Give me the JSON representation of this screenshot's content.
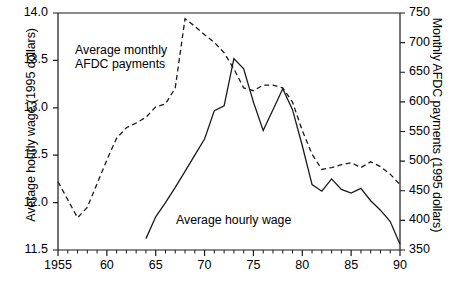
{
  "chart_data": {
    "type": "line",
    "title": "",
    "xlabel": "",
    "grid": false,
    "legend_position": "inline-annotations",
    "xlim": [
      1955,
      1990
    ],
    "x_ticks_major": [
      1955,
      1960,
      1965,
      1970,
      1975,
      1980,
      1985,
      1990
    ],
    "x_tick_labels": [
      "1955",
      "60",
      "65",
      "70",
      "75",
      "80",
      "85",
      "90"
    ],
    "x_minor_tick_interval": 1,
    "axes": {
      "left": {
        "label": "Average hourly wage (1995 dollars)",
        "ylim": [
          11.5,
          14.0
        ],
        "ticks": [
          11.5,
          12.0,
          12.5,
          13.0,
          13.5,
          14.0
        ],
        "tick_labels": [
          "11.5",
          "12.0",
          "12.5",
          "13.0",
          "13.5",
          "14.0"
        ]
      },
      "right": {
        "label": "Monthly AFDC payments (1995 dollars)",
        "ylim": [
          350,
          750
        ],
        "ticks": [
          350,
          400,
          450,
          500,
          550,
          600,
          650,
          700,
          750
        ],
        "tick_labels": [
          "350",
          "400",
          "450",
          "500",
          "550",
          "600",
          "650",
          "700",
          "750"
        ]
      }
    },
    "series": [
      {
        "name": "Average monthly AFDC payments",
        "axis": "right",
        "style": "dashed",
        "color": "#000000",
        "annotation": "Average monthly\nAFDC payments",
        "x": [
          1955,
          1956,
          1957,
          1958,
          1959,
          1960,
          1961,
          1962,
          1963,
          1964,
          1965,
          1966,
          1967,
          1968,
          1969,
          1970,
          1971,
          1972,
          1973,
          1974,
          1975,
          1976,
          1977,
          1978,
          1979,
          1980,
          1981,
          1982,
          1983,
          1984,
          1985,
          1986,
          1987,
          1988,
          1989,
          1990
        ],
        "values_right_axis": [
          471,
          440,
          409,
          432,
          470,
          512,
          549,
          566,
          574,
          584,
          601,
          607,
          634,
          740,
          727,
          713,
          700,
          683,
          655,
          622,
          617,
          627,
          626,
          622,
          600,
          552,
          512,
          486,
          489,
          494,
          497,
          489,
          499,
          491,
          478,
          460
        ],
        "values_left_axis": [
          12.22,
          12.03,
          11.84,
          11.95,
          12.2,
          12.45,
          12.68,
          12.79,
          12.84,
          12.9,
          13.01,
          13.04,
          13.21,
          13.94,
          13.86,
          13.77,
          13.69,
          13.58,
          13.41,
          13.21,
          13.18,
          13.24,
          13.24,
          13.21,
          13.06,
          12.76,
          12.51,
          12.35,
          12.37,
          12.4,
          12.42,
          12.37,
          12.43,
          12.38,
          12.3,
          12.19
        ]
      },
      {
        "name": "Average hourly wage",
        "axis": "left",
        "style": "solid",
        "color": "#000000",
        "annotation": "Average hourly wage",
        "x": [
          1964,
          1965,
          1966,
          1967,
          1968,
          1969,
          1970,
          1971,
          1972,
          1973,
          1974,
          1975,
          1976,
          1977,
          1978,
          1979,
          1980,
          1981,
          1982,
          1983,
          1984,
          1985,
          1986,
          1987,
          1988,
          1989,
          1990
        ],
        "values_left_axis": [
          11.62,
          11.85,
          12.0,
          12.16,
          12.33,
          12.5,
          12.67,
          12.97,
          13.02,
          13.52,
          13.41,
          13.06,
          12.76,
          12.98,
          13.2,
          12.98,
          12.6,
          12.19,
          12.12,
          12.25,
          12.14,
          12.1,
          12.15,
          12.02,
          11.92,
          11.8,
          11.56
        ],
        "values_right_axis": [
          368,
          406,
          430,
          456,
          483,
          510,
          537,
          585,
          593,
          673,
          655,
          599,
          551,
          587,
          622,
          586,
          526,
          461,
          449,
          470,
          452,
          446,
          454,
          433,
          417,
          398,
          360
        ]
      }
    ]
  }
}
